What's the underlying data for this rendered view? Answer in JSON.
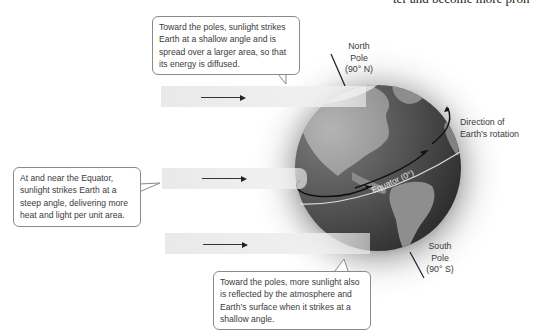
{
  "cut_off_text": "ter and become more pron",
  "callouts": {
    "top": "Toward the poles, sunlight strikes Earth at a shallow angle and is spread over a larger area, so that its energy is diffused.",
    "left": "At and near the Equator, sunlight strikes Earth at a steep angle, delivering more heat and light per unit area.",
    "bottom": "Toward the poles, more sunlight also is reflected by the atmosphere and Earth’s surface when it strikes at a shallow angle."
  },
  "labels": {
    "north_pole": [
      "North",
      "Pole",
      "(90° N)"
    ],
    "south_pole": [
      "South",
      "Pole",
      "(90° S)"
    ],
    "rotation": [
      "Direction of",
      "Earth’s rotation"
    ],
    "equator": "Equator (0°)"
  },
  "icons": {
    "sunlight_arrow": "right-arrow",
    "rotation_arrow": "curved-arrow"
  },
  "colors": {
    "callout_border": "#8a8a8a",
    "beam": "#e8e8e8",
    "globe_dark": "#3d3d3d",
    "globe_land": "#8c8c8c",
    "equator_line": "#d8d8d8"
  }
}
